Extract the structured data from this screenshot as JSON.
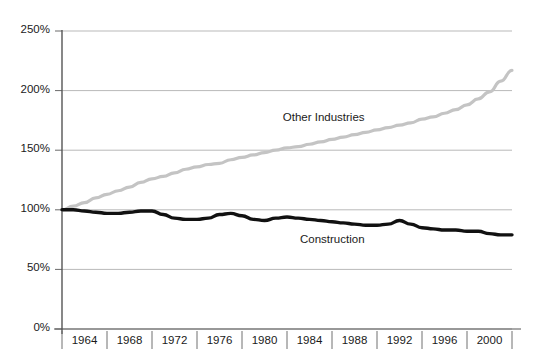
{
  "chart_data": {
    "type": "line",
    "title": "",
    "subtitle": "",
    "xlabel": "",
    "ylabel": "",
    "xlim": [
      1962,
      2002
    ],
    "ylim": [
      0,
      250
    ],
    "ytick_labels": [
      "250%",
      "200%",
      "150%",
      "100%",
      "50%",
      "0%"
    ],
    "ytick_values": [
      250,
      200,
      150,
      100,
      50,
      0
    ],
    "xtick_labels": [
      "1964",
      "1968",
      "1972",
      "1976",
      "1980",
      "1984",
      "1988",
      "1992",
      "1996",
      "2000"
    ],
    "xtick_values": [
      1964,
      1968,
      1972,
      1976,
      1980,
      1984,
      1988,
      1992,
      1996,
      2000
    ],
    "grid": "horizontal",
    "legend_position": "inline-annotation",
    "series": [
      {
        "name": "Other Industries",
        "color": "#c4c4c4",
        "label_x": 1985,
        "label_y": 176,
        "x": [
          1962,
          1963,
          1964,
          1965,
          1966,
          1967,
          1968,
          1969,
          1970,
          1971,
          1972,
          1973,
          1974,
          1975,
          1976,
          1977,
          1978,
          1979,
          1980,
          1981,
          1982,
          1983,
          1984,
          1985,
          1986,
          1987,
          1988,
          1989,
          1990,
          1991,
          1992,
          1993,
          1994,
          1995,
          1996,
          1997,
          1998,
          1999,
          2000,
          2001,
          2002
        ],
        "values": [
          100,
          103,
          106,
          110,
          113,
          116,
          119,
          123,
          126,
          128,
          131,
          134,
          136,
          138,
          139,
          142,
          144,
          146,
          148,
          150,
          152,
          153,
          155,
          157,
          159,
          161,
          163,
          165,
          167,
          169,
          171,
          173,
          176,
          178,
          181,
          184,
          188,
          193,
          199,
          208,
          217
        ]
      },
      {
        "name": "Construction",
        "color": "#111111",
        "label_x": 1986,
        "label_y": 74,
        "x": [
          1962,
          1963,
          1964,
          1965,
          1966,
          1967,
          1968,
          1969,
          1970,
          1971,
          1972,
          1973,
          1974,
          1975,
          1976,
          1977,
          1978,
          1979,
          1980,
          1981,
          1982,
          1983,
          1984,
          1985,
          1986,
          1987,
          1988,
          1989,
          1990,
          1991,
          1992,
          1993,
          1994,
          1995,
          1996,
          1997,
          1998,
          1999,
          2000,
          2001,
          2002
        ],
        "values": [
          100,
          100,
          99,
          98,
          97,
          97,
          98,
          99,
          99,
          96,
          93,
          92,
          92,
          93,
          96,
          97,
          95,
          92,
          91,
          93,
          94,
          93,
          92,
          91,
          90,
          89,
          88,
          87,
          87,
          88,
          91,
          88,
          85,
          84,
          83,
          83,
          82,
          82,
          80,
          79,
          79
        ]
      }
    ]
  }
}
